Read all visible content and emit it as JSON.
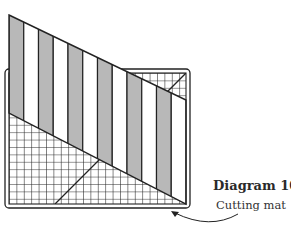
{
  "diagram": {
    "title": "Diagram 10",
    "label": "Cutting mat",
    "colors": {
      "line": "#222222",
      "stripe_dark": "#b8b8b8",
      "stripe_light": "#ffffff",
      "background": "#ffffff"
    },
    "stripes": {
      "count": 12,
      "pattern": [
        "dark",
        "light"
      ]
    },
    "mat": {
      "grid": true,
      "diagonal_45_lines": 2
    }
  }
}
